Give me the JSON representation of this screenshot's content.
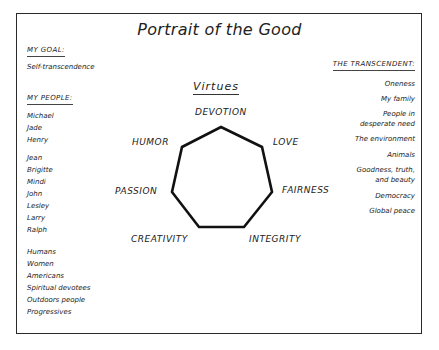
{
  "title": "Portrait of the Good",
  "goal": {
    "heading": "My Goal:",
    "value": "Self-transcendence"
  },
  "people": {
    "heading": "My People:",
    "group1": [
      "Michael",
      "Jade",
      "Henry"
    ],
    "group2": [
      "Jean",
      "Brigitte",
      "Mindi",
      "John",
      "Lesley",
      "Larry",
      "Ralph"
    ],
    "group3": [
      "Humans",
      "Women",
      "Americans",
      "Spiritual devotees",
      "Outdoors people",
      "Progressives"
    ]
  },
  "transcendent": {
    "heading": "The Transcendent:",
    "items": [
      "Oneness",
      "My family",
      "People in",
      "desperate need",
      "The environment",
      "Animals",
      "Goodness, truth,",
      "and beauty",
      "Democracy",
      "Global peace"
    ]
  },
  "virtues": {
    "heading": "Virtues",
    "items": [
      "Devotion",
      "Love",
      "Fairness",
      "Integrity",
      "Creativity",
      "Passion",
      "Humor"
    ]
  },
  "colors": {
    "line": "#111111",
    "frame": "#2a2a2a",
    "background": "#ffffff"
  }
}
